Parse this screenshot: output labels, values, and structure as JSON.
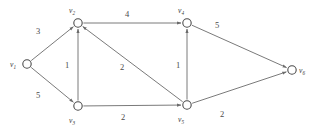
{
  "figure": {
    "type": "directed-weighted-graph",
    "background_color": "#ffffff",
    "edge_color": "#6b6b6b",
    "node_fill": "#ffffff",
    "node_stroke": "#4a4a4a",
    "text_color": "#3a3a3a"
  },
  "nodes": [
    {
      "id": "v1",
      "name": "v",
      "sub": "1",
      "x": 27,
      "y": 64,
      "r": 4.2,
      "label_x": 13,
      "label_y": 67
    },
    {
      "id": "v2",
      "name": "v",
      "sub": "2",
      "x": 78,
      "y": 23,
      "r": 4.2,
      "label_x": 72,
      "label_y": 13
    },
    {
      "id": "v3",
      "name": "v",
      "sub": "3",
      "x": 78,
      "y": 106,
      "r": 4.2,
      "label_x": 72,
      "label_y": 123
    },
    {
      "id": "v4",
      "name": "v",
      "sub": "4",
      "x": 187,
      "y": 23,
      "r": 4.2,
      "label_x": 181,
      "label_y": 13
    },
    {
      "id": "v5",
      "name": "v",
      "sub": "5",
      "x": 187,
      "y": 105,
      "r": 4.2,
      "label_x": 181,
      "label_y": 122
    },
    {
      "id": "v6",
      "name": "v",
      "sub": "6",
      "x": 292,
      "y": 70,
      "r": 4.2,
      "label_x": 302,
      "label_y": 73
    }
  ],
  "edges": [
    {
      "id": "e-v1-v2",
      "from": "v1",
      "to": "v2",
      "weight": "3",
      "label_x": 38,
      "label_y": 34
    },
    {
      "id": "e-v1-v3",
      "from": "v1",
      "to": "v3",
      "weight": "5",
      "label_x": 38,
      "label_y": 98
    },
    {
      "id": "e-v3-v2",
      "from": "v3",
      "to": "v2",
      "weight": "1",
      "label_x": 67,
      "label_y": 68
    },
    {
      "id": "e-v2-v4",
      "from": "v2",
      "to": "v4",
      "weight": "4",
      "label_x": 127,
      "label_y": 17
    },
    {
      "id": "e-v5-v2",
      "from": "v5",
      "to": "v2",
      "weight": "2",
      "label_x": 122,
      "label_y": 70
    },
    {
      "id": "e-v5-v4",
      "from": "v5",
      "to": "v4",
      "weight": "1",
      "label_x": 178,
      "label_y": 68
    },
    {
      "id": "e-v3-v5",
      "from": "v3",
      "to": "v5",
      "weight": "2",
      "label_x": 123,
      "label_y": 120
    },
    {
      "id": "e-v4-v6",
      "from": "v4",
      "to": "v6",
      "weight": "5",
      "label_x": 217,
      "label_y": 28
    },
    {
      "id": "e-v5-v6",
      "from": "v5",
      "to": "v6",
      "weight": "2",
      "label_x": 222,
      "label_y": 117
    }
  ]
}
